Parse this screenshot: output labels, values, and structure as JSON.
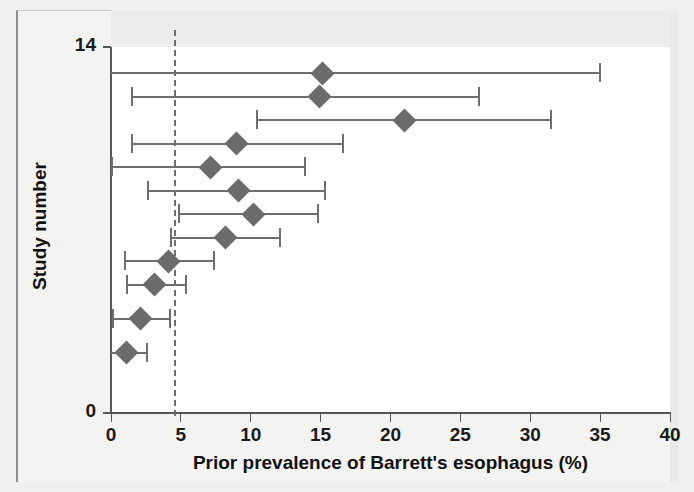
{
  "chart_data": {
    "type": "scatter",
    "title": "",
    "xlabel": "Prior prevalence of Barrett's esophagus (%)",
    "ylabel": "Study number",
    "xlim": [
      0,
      40
    ],
    "ylim": [
      0,
      14
    ],
    "xticks": [
      0,
      5,
      10,
      15,
      20,
      25,
      30,
      35,
      40
    ],
    "xtick_labels": [
      "0",
      "5",
      "10",
      "15",
      "20",
      "25",
      "30",
      "35",
      "40"
    ],
    "yticks": [
      0,
      14
    ],
    "ytick_labels": [
      "0",
      "14"
    ],
    "grid": false,
    "legend": null,
    "reference_line": {
      "orientation": "vertical",
      "value": 4.6,
      "style": "dashed",
      "color": "#6e6e6e"
    },
    "marker_shape": "diamond",
    "marker_color": "#6b6b6b",
    "line_color": "#6f6f6f",
    "series": [
      {
        "name": "Prior prevalence with 95% interval",
        "points": [
          {
            "study": 13.0,
            "value": 15.1,
            "low": 0.0,
            "high": 35.0,
            "low_capped": false,
            "high_capped": true
          },
          {
            "study": 12.1,
            "value": 14.9,
            "low": 1.4,
            "high": 26.3,
            "low_capped": true,
            "high_capped": true
          },
          {
            "study": 11.2,
            "value": 21.0,
            "low": 10.4,
            "high": 31.5,
            "low_capped": true,
            "high_capped": true
          },
          {
            "study": 10.3,
            "value": 9.0,
            "low": 1.4,
            "high": 16.6,
            "low_capped": true,
            "high_capped": true
          },
          {
            "study": 9.4,
            "value": 7.1,
            "low": 0.0,
            "high": 13.9,
            "low_capped": true,
            "high_capped": true
          },
          {
            "study": 8.5,
            "value": 9.1,
            "low": 2.6,
            "high": 15.3,
            "low_capped": true,
            "high_capped": true
          },
          {
            "study": 7.6,
            "value": 10.2,
            "low": 4.8,
            "high": 14.8,
            "low_capped": true,
            "high_capped": true
          },
          {
            "study": 6.7,
            "value": 8.2,
            "low": 4.2,
            "high": 12.1,
            "low_capped": true,
            "high_capped": true
          },
          {
            "study": 5.8,
            "value": 4.1,
            "low": 0.9,
            "high": 7.4,
            "low_capped": true,
            "high_capped": true
          },
          {
            "study": 4.9,
            "value": 3.1,
            "low": 1.1,
            "high": 5.4,
            "low_capped": true,
            "high_capped": true
          },
          {
            "study": 3.6,
            "value": 2.1,
            "low": 0.1,
            "high": 4.2,
            "low_capped": true,
            "high_capped": true
          },
          {
            "study": 2.3,
            "value": 1.1,
            "low": 0.0,
            "high": 2.6,
            "low_capped": false,
            "high_capped": true
          }
        ]
      }
    ]
  },
  "axis": {
    "x_label": "Prior prevalence of Barrett's esophagus (%)",
    "y_label": "Study number",
    "y_top_label": "14",
    "y_bottom_label": "0"
  }
}
